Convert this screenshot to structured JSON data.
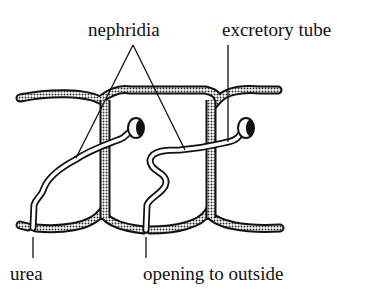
{
  "diagram": {
    "labels": {
      "nephridia": "nephridia",
      "excretory_tube": "excretory tube",
      "urea": "urea",
      "opening": "opening to outside"
    },
    "colors": {
      "ink": "#111111",
      "background": "#ffffff",
      "septum_fill": "#9a9a9a"
    }
  }
}
